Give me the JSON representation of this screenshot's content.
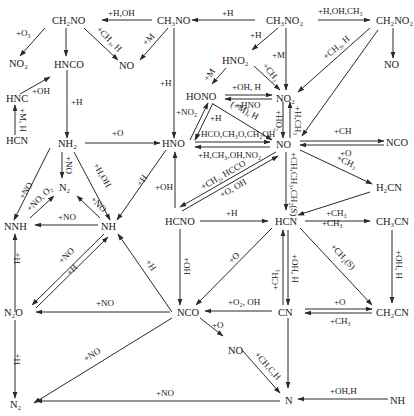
{
  "diagram": {
    "type": "reaction-pathway",
    "species": {
      "CH2NO_left": "CH₂NO",
      "CH3NO": "CH₃NO",
      "CH3NO2": "CH₃NO₂",
      "CH2NO2": "CH₂NO₂",
      "NO2_left": "NO₂",
      "HNCO": "HNCO",
      "NO_top": "NO",
      "NO_right": "NO",
      "HNO2": "HNO₂",
      "HONO": "HONO",
      "NO2": "NO₂",
      "HNC": "HNC",
      "HCN_left": "HCN",
      "NH2": "NH₂",
      "HNO": "HNO",
      "NO": "NO",
      "NCO_right": "NCO",
      "H2CN": "H₂CN",
      "N2_mid": "N₂",
      "NNH": "NNH",
      "NH": "NH",
      "HCNO": "HCNO",
      "HCN": "HCN",
      "CH3CN": "CH₃CN",
      "N2O": "N₂O",
      "NCO": "NCO",
      "CN": "CN",
      "CH2CN": "CH₂CN",
      "NO_low": "NO",
      "N2_bottom": "N₂",
      "N": "N",
      "NH_bottom": "NH"
    },
    "labels": {
      "ch3no_to_ch2no": "+H,OH",
      "ch3no2_to_ch3no": "+H",
      "ch3no2_to_ch2no2": "+H,OH,CH₃",
      "ch2no_to_no2": "+O₃",
      "ch2no_to_no": "+CH₃, H",
      "ch3no_to_no": "+M",
      "ch3no2_to_hno2": "+H",
      "ch3no2_to_no2": "+M",
      "hno2_to_no2": "+CH₃",
      "hno2_to_hono": "+M",
      "ch2no2_to_no2": "+CH₃, H",
      "hnc_to_hnco": "+OH",
      "hcn_to_hnc": "+M, H",
      "hnco_to_nh2": "+H",
      "ch3no_to_hno": "+H",
      "hono_to_no2": "+OH, H",
      "no2_to_hono": "+HNO",
      "hono_to_no": "(+M), H",
      "hno_to_hono": "+NO₂",
      "hono_to_hno": "+H",
      "no2_to_no": "+HO₂",
      "no_to_no2": "+H,CH₃",
      "hno_to_no": "+HCO,CH₃O,CH₂OH",
      "no_to_hno": "+H,CH₃,OH,NO₂",
      "nh2_to_hno": "+O",
      "no_to_nco": "+CH",
      "nco_to_no": "+O",
      "no_to_h2cn": "+CH₃",
      "nh2_to_n2": "+NO",
      "nh2_to_nh": "+H,OH",
      "hno_to_nh": "+H",
      "nh2_to_nnh": "+NO",
      "nnh_to_n2": "+NO, O₂",
      "nh_to_n2": "+NO",
      "no_to_hcno": "+CH₃, HCCO",
      "hcno_to_no": "+O, OH",
      "no_to_hcn": "+CH,CH₃,CH₂(S)",
      "hcno_to_hno": "+OH",
      "nh_to_nnh": "+NO",
      "hcno_to_hcn": "+H",
      "h2cn_to_hcn": "+CH₃",
      "hcn_to_ch3cn": "+CH₃",
      "nnh_from_n2o": "H+",
      "nh_to_n2o": "+NO",
      "n2o_to_nh": "+H",
      "nco_to_nh": "+H",
      "hcno_to_nco": "+OH",
      "hcn_to_nco": "+O",
      "cn_to_hcn": "+CH₃",
      "hcn_to_cn": "+OH, H",
      "hcn_to_ch2cn": "+CH₂(S)",
      "ch3cn_to_ch2cn": "+OH, H",
      "nco_to_n2o": "+NO",
      "cn_to_nco": "+O₂, OH",
      "cn_to_ch2cn": "+O",
      "ch2cn_to_cn": "+CH₃",
      "n2o_to_n2": "H+",
      "nco_to_n2": "+NO",
      "nco_to_no_low": "+O",
      "no_low_to_n": "+CH,C,H",
      "n_to_n2": "+NO",
      "nh_to_n": "+OH,H"
    }
  }
}
